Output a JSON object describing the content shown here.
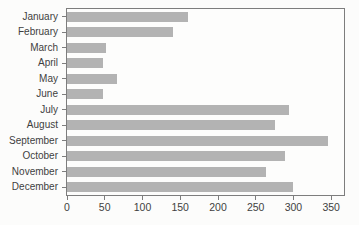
{
  "figure": {
    "background_color": "#fcfcfb",
    "title": ""
  },
  "chart_data": {
    "type": "bar",
    "orientation": "horizontal",
    "title": "",
    "xlabel": "",
    "ylabel": "",
    "categories": [
      "January",
      "February",
      "March",
      "April",
      "May",
      "June",
      "July",
      "August",
      "September",
      "October",
      "November",
      "December"
    ],
    "values": [
      160,
      141,
      51,
      47,
      66,
      47,
      294,
      276,
      346,
      289,
      264,
      300
    ],
    "x_ticks": [
      0,
      50,
      100,
      150,
      200,
      250,
      300,
      350
    ],
    "xlim": [
      0,
      367
    ],
    "grid": false,
    "legend": false,
    "bar_color": "#b3b3b3",
    "frame_color": "#7d7d7d",
    "tick_label_color": "#3f3f3f",
    "plot_background": "#fdfdfc"
  }
}
